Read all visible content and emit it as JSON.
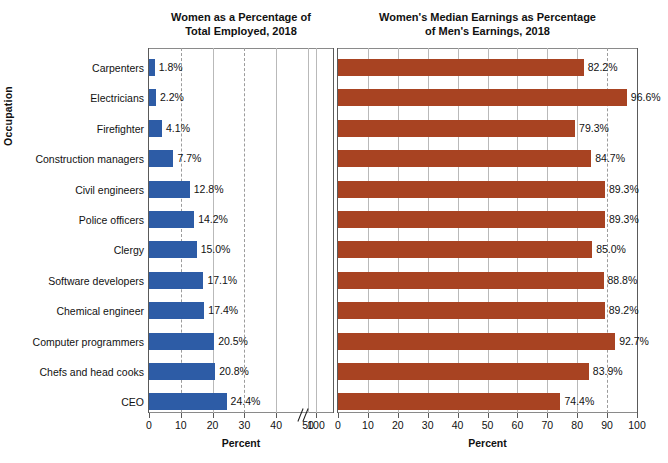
{
  "axes": {
    "y_title": "Occupation",
    "x_title": "Percent"
  },
  "panels": [
    {
      "id": "left",
      "title_line1": "Women as a Percentage of",
      "title_line2": "Total Employed, 2018",
      "xlabel": "Percent",
      "bar_color": "#2d5ca6",
      "ticks": [
        "0",
        "10",
        "20",
        "30",
        "40",
        "50",
        "100"
      ],
      "axis_break": true
    },
    {
      "id": "right",
      "title_line1": "Women's Median Earnings as Percentage",
      "title_line2": "of Men's Earnings, 2018",
      "xlabel": "Percent",
      "bar_color": "#a84322",
      "ticks": [
        "0",
        "10",
        "20",
        "30",
        "40",
        "50",
        "60",
        "70",
        "80",
        "90",
        "100"
      ],
      "axis_break": false
    }
  ],
  "categories": [
    "Carpenters",
    "Electricians",
    "Firefighter",
    "Construction managers",
    "Civil engineers",
    "Police officers",
    "Clergy",
    "Software developers",
    "Chemical engineer",
    "Computer programmers",
    "Chefs and head cooks",
    "CEO"
  ],
  "left_values": [
    1.8,
    2.2,
    4.1,
    7.7,
    12.8,
    14.2,
    15.0,
    17.1,
    17.4,
    20.5,
    20.8,
    24.4
  ],
  "left_labels": [
    "1.8%",
    "2.2%",
    "4.1%",
    "7.7%",
    "12.8%",
    "14.2%",
    "15.0%",
    "17.1%",
    "17.4%",
    "20.5%",
    "20.8%",
    "24.4%"
  ],
  "right_values": [
    82.2,
    96.6,
    79.3,
    84.7,
    89.3,
    89.3,
    85.0,
    88.8,
    89.2,
    92.7,
    83.9,
    74.4
  ],
  "right_labels": [
    "82.2%",
    "96.6%",
    "79.3%",
    "84.7%",
    "89.3%",
    "89.3%",
    "85.0%",
    "88.8%",
    "89.2%",
    "92.7%",
    "83.9%",
    "74.4%"
  ],
  "chart_data": [
    {
      "type": "bar",
      "orientation": "horizontal",
      "title": "Women as a Percentage of Total Employed, 2018",
      "xlabel": "Percent",
      "ylabel": "Occupation",
      "xlim": [
        0,
        100
      ],
      "xticks": [
        0,
        10,
        20,
        30,
        40,
        50,
        100
      ],
      "axis_break_between": [
        50,
        100
      ],
      "grid": true,
      "bar_color": "#2d5ca6",
      "categories": [
        "Carpenters",
        "Electricians",
        "Firefighter",
        "Construction managers",
        "Civil engineers",
        "Police officers",
        "Clergy",
        "Software developers",
        "Chemical engineer",
        "Computer programmers",
        "Chefs and head cooks",
        "CEO"
      ],
      "values": [
        1.8,
        2.2,
        4.1,
        7.7,
        12.8,
        14.2,
        15.0,
        17.1,
        17.4,
        20.5,
        20.8,
        24.4
      ],
      "data_labels": [
        "1.8%",
        "2.2%",
        "4.1%",
        "7.7%",
        "12.8%",
        "14.2%",
        "15.0%",
        "17.1%",
        "17.4%",
        "20.5%",
        "20.8%",
        "24.4%"
      ]
    },
    {
      "type": "bar",
      "orientation": "horizontal",
      "title": "Women's Median Earnings as Percentage of Men's Earnings, 2018",
      "xlabel": "Percent",
      "ylabel": "Occupation",
      "xlim": [
        0,
        100
      ],
      "xticks": [
        0,
        10,
        20,
        30,
        40,
        50,
        60,
        70,
        80,
        90,
        100
      ],
      "grid": true,
      "bar_color": "#a84322",
      "categories": [
        "Carpenters",
        "Electricians",
        "Firefighter",
        "Construction managers",
        "Civil engineers",
        "Police officers",
        "Clergy",
        "Software developers",
        "Chemical engineer",
        "Computer programmers",
        "Chefs and head cooks",
        "CEO"
      ],
      "values": [
        82.2,
        96.6,
        79.3,
        84.7,
        89.3,
        89.3,
        85.0,
        88.8,
        89.2,
        92.7,
        83.9,
        74.4
      ],
      "data_labels": [
        "82.2%",
        "96.6%",
        "79.3%",
        "84.7%",
        "89.3%",
        "89.3%",
        "85.0%",
        "88.8%",
        "89.2%",
        "92.7%",
        "83.9%",
        "74.4%"
      ]
    }
  ]
}
